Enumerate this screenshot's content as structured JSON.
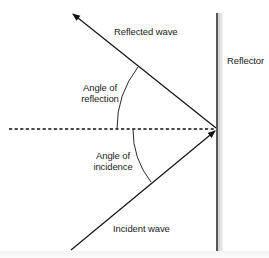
{
  "diagram": {
    "labels": {
      "reflected_wave": "Reflected wave",
      "reflector": "Reflector",
      "angle_of_reflection_line1": "Angle of",
      "angle_of_reflection_line2": "reflection",
      "angle_of_incidence_line1": "Angle of",
      "angle_of_incidence_line2": "incidence",
      "incident_wave": "Incident wave"
    },
    "geometry": {
      "reflection_point": [
        217,
        129
      ],
      "reflected_wave_end": [
        72,
        13
      ],
      "incident_wave_start": [
        70,
        250
      ],
      "normal_line_start": [
        8,
        129
      ],
      "reflector_x": 217,
      "reflector_y_range": [
        13,
        250
      ]
    },
    "colors": {
      "line": "#111111",
      "reflector_shadow": "#d8d8d8",
      "background": "#ffffff"
    }
  }
}
